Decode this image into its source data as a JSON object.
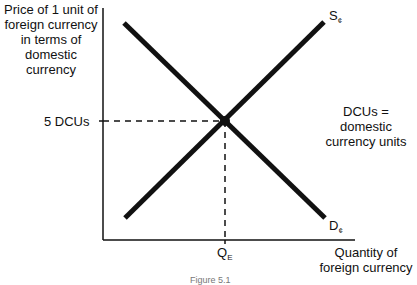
{
  "diagram": {
    "y_axis_label": "Price of 1 unit of foreign currency in terms of domestic currency",
    "x_axis_label": "Quantity of foreign currency",
    "equilibrium_price_label": "5 DCUs",
    "equilibrium_quantity_label": "Q",
    "equilibrium_quantity_subscript": "E",
    "supply_label": "S",
    "supply_subscript": "¢",
    "demand_label": "D",
    "demand_subscript": "¢",
    "note": "DCUs = domestic currency units",
    "caption": "Figure 5.1"
  },
  "colors": {
    "line": "#111111",
    "background": "#ffffff"
  }
}
